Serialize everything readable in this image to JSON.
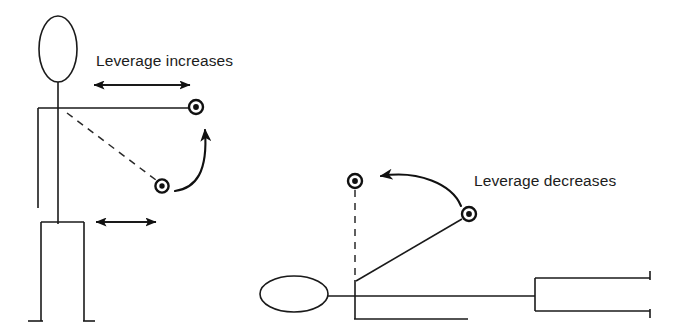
{
  "diagram": {
    "background_color": "#ffffff",
    "ink_color": "#111111",
    "labels": {
      "left_caption": "Leverage increases",
      "right_caption": "Leverage decreases"
    },
    "panels": [
      {
        "id": "standing-panel",
        "name": "standing-figure-panel",
        "posture": "standing",
        "caption": "Leverage increases",
        "caption_position": {
          "x": 96,
          "y": 66
        },
        "figure": {
          "head": {
            "cx": 58,
            "cy": 49,
            "rx": 19,
            "ry": 33
          },
          "neck": {
            "x1": 58,
            "y1": 82,
            "x2": 58,
            "y2": 108
          },
          "shoulder_line": {
            "x1": 38,
            "y1": 108,
            "x2": 196,
            "y2": 108
          },
          "back": {
            "x1": 38,
            "y1": 108,
            "x2": 38,
            "y2": 208
          },
          "spine": {
            "x1": 58,
            "y1": 108,
            "x2": 58,
            "y2": 222
          },
          "hip_line": {
            "x1": 41,
            "y1": 222,
            "x2": 84,
            "y2": 222
          },
          "front_leg": {
            "x1": 41,
            "y1": 222,
            "x2": 41,
            "y2": 320
          },
          "back_leg": {
            "x1": 84,
            "y1": 222,
            "x2": 84,
            "y2": 320
          },
          "foot_left": {
            "x1": 28,
            "y1": 320,
            "x2": 43,
            "y2": 320
          },
          "foot_right": {
            "x1": 84,
            "y1": 320,
            "x2": 95,
            "y2": 320
          }
        },
        "weights": [
          {
            "name": "weight-extended",
            "cx": 196,
            "cy": 107,
            "r_outer": 7,
            "r_dot": 2.9,
            "state": "arm-extended-horizontal"
          },
          {
            "name": "weight-lowered",
            "cx": 162,
            "cy": 186,
            "r_outer": 6.5,
            "r_dot": 2.7,
            "state": "arm-lowered-diagonal"
          }
        ],
        "dashed_arm": {
          "x1": 66,
          "y1": 112,
          "x2": 157,
          "y2": 181
        },
        "rotation_arrow": {
          "name": "upward-rotation-arrow",
          "direction": "counter-clockwise-up",
          "from": {
            "x": 176,
            "y": 190
          },
          "to": {
            "x": 204,
            "y": 124
          }
        },
        "measure_arrows": [
          {
            "name": "leverage-span-long",
            "x1": 88,
            "y1": 85,
            "x2": 196,
            "y2": 85,
            "length_px": 108,
            "meaning": "long moment arm"
          },
          {
            "name": "leverage-span-short",
            "x1": 90,
            "y1": 222,
            "x2": 162,
            "y2": 222,
            "length_px": 72,
            "meaning": "short moment arm"
          }
        ]
      },
      {
        "id": "lying-panel",
        "name": "lying-figure-panel",
        "posture": "lying-on-bench",
        "caption": "Leverage decreases",
        "caption_position": {
          "x": 474,
          "y": 186
        },
        "figure": {
          "head": {
            "cx": 294,
            "cy": 294,
            "rx": 34,
            "ry": 18
          },
          "neck": {
            "x1": 328,
            "y1": 296,
            "x2": 355,
            "y2": 296
          },
          "body_line": {
            "x1": 330,
            "y1": 296,
            "x2": 535,
            "y2": 296
          },
          "torso_top": {
            "x1": 355,
            "y1": 281,
            "x2": 355,
            "y2": 296
          },
          "torso_front": {
            "x1": 355,
            "y1": 296,
            "x2": 355,
            "y2": 318
          },
          "bench_line": {
            "x1": 355,
            "y1": 318,
            "x2": 468,
            "y2": 318
          },
          "legs_box": {
            "x": 535,
            "y": 278,
            "width": 115,
            "height": 33
          },
          "legs_box_right_open": true
        },
        "weights": [
          {
            "name": "weight-over-chest",
            "cx": 355,
            "cy": 181,
            "r_outer": 7,
            "r_dot": 2.9,
            "state": "arm-vertical"
          },
          {
            "name": "weight-extended-diagonal",
            "cx": 469,
            "cy": 214,
            "r_outer": 7,
            "r_dot": 2.9,
            "state": "arm-extended-diagonal"
          }
        ],
        "dashed_arm": {
          "x1": 355,
          "y1": 190,
          "x2": 355,
          "y2": 278
        },
        "solid_arm": {
          "x1": 356,
          "y1": 281,
          "x2": 462,
          "y2": 218
        },
        "rotation_arrow": {
          "name": "leftward-rotation-arrow",
          "direction": "clockwise-left",
          "from": {
            "x": 458,
            "y": 205
          },
          "to": {
            "x": 374,
            "y": 177
          }
        }
      }
    ]
  }
}
